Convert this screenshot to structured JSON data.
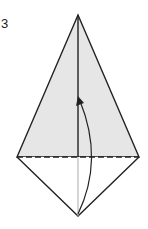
{
  "step": {
    "number": "3"
  },
  "diagram": {
    "colors": {
      "paper_fill": "#e6e6e6",
      "stroke": "#222222",
      "hidden_line": "#aaaaaa",
      "background": "#ffffff"
    },
    "shapes": {
      "upper_triangle": {
        "apex": [
          78,
          15
        ],
        "left": [
          17,
          157
        ],
        "right": [
          139,
          157
        ]
      },
      "lower_triangle": {
        "left": [
          17,
          157
        ],
        "right": [
          139,
          157
        ],
        "bottom": [
          78,
          216
        ]
      },
      "fold_line": {
        "from": [
          17,
          157
        ],
        "to": [
          139,
          157
        ],
        "style": "dashed"
      },
      "center_crease_upper": {
        "from": [
          78,
          15
        ],
        "to": [
          78,
          157
        ]
      },
      "center_crease_lower": {
        "from": [
          78,
          157
        ],
        "to": [
          78,
          216
        ]
      },
      "fold_arrow": {
        "start": [
          78,
          214
        ],
        "control": [
          104,
          160
        ],
        "end": [
          79,
          98
        ]
      }
    }
  }
}
